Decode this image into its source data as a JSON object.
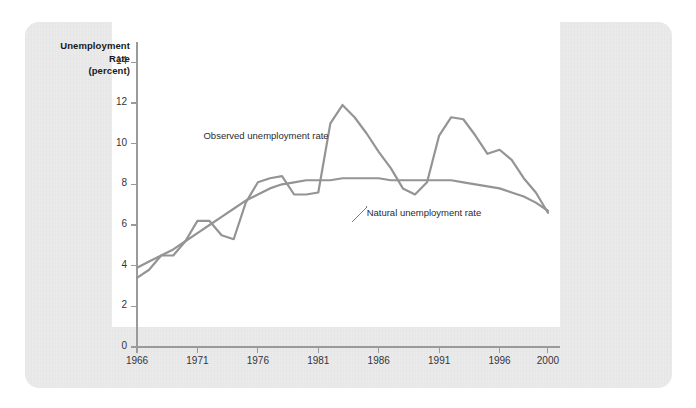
{
  "figure": {
    "axis_title_lines": [
      "Unemployment",
      "Rate",
      "(percent)"
    ],
    "axis_title_line1": "Unemployment",
    "axis_title_line2": "Rate",
    "axis_title_line3": "(percent)",
    "line_color": "#949494",
    "card_color": "#ebebeb",
    "plot_bg": "#ffffff",
    "axis_color": "#9a9a9a"
  },
  "chart_data": {
    "type": "line",
    "title": "Unemployment Rate (percent)",
    "xlabel": "",
    "ylabel": "Unemployment Rate (percent)",
    "xlim": [
      1966,
      2001
    ],
    "ylim": [
      0,
      15
    ],
    "yticks": [
      0,
      2,
      4,
      6,
      8,
      10,
      12,
      14
    ],
    "ytick_labels": [
      "0",
      "2",
      "4",
      "6",
      "8",
      "10",
      "12",
      "14"
    ],
    "xticks": [
      1966,
      1971,
      1976,
      1981,
      1986,
      1991,
      1996,
      2000
    ],
    "xtick_labels": [
      "1966",
      "1971",
      "1976",
      "1981",
      "1986",
      "1991",
      "1996",
      "2000"
    ],
    "grid": false,
    "legend": "annotations",
    "annotations": [
      {
        "text": "Observed unemployment rate",
        "x": 1971.5,
        "y": 10.4
      },
      {
        "text": "Natural unemployment rate",
        "x": 1985.0,
        "y": 6.6
      }
    ],
    "series": [
      {
        "name": "Observed unemployment rate",
        "x": [
          1966,
          1967,
          1968,
          1969,
          1970,
          1971,
          1972,
          1973,
          1974,
          1975,
          1976,
          1977,
          1978,
          1979,
          1980,
          1981,
          1982,
          1983,
          1984,
          1985,
          1986,
          1987,
          1988,
          1989,
          1990,
          1991,
          1992,
          1993,
          1994,
          1995,
          1996,
          1997,
          1998,
          1999,
          2000
        ],
        "y": [
          3.4,
          3.8,
          4.5,
          4.5,
          5.2,
          6.2,
          6.2,
          5.5,
          5.3,
          7.1,
          8.1,
          8.3,
          8.4,
          7.5,
          7.5,
          7.6,
          11.0,
          11.9,
          11.3,
          10.5,
          9.6,
          8.8,
          7.8,
          7.5,
          8.1,
          10.4,
          11.3,
          11.2,
          10.4,
          9.5,
          9.7,
          9.2,
          8.3,
          7.6,
          6.6
        ]
      },
      {
        "name": "Natural unemployment rate",
        "x": [
          1966,
          1967,
          1968,
          1969,
          1970,
          1971,
          1972,
          1973,
          1974,
          1975,
          1976,
          1977,
          1978,
          1979,
          1980,
          1981,
          1982,
          1983,
          1984,
          1985,
          1986,
          1987,
          1988,
          1989,
          1990,
          1991,
          1992,
          1993,
          1994,
          1995,
          1996,
          1997,
          1998,
          1999,
          2000
        ],
        "y": [
          3.9,
          4.2,
          4.5,
          4.8,
          5.2,
          5.6,
          6.0,
          6.4,
          6.8,
          7.2,
          7.5,
          7.8,
          8.0,
          8.1,
          8.2,
          8.2,
          8.2,
          8.3,
          8.3,
          8.3,
          8.3,
          8.2,
          8.2,
          8.2,
          8.2,
          8.2,
          8.2,
          8.1,
          8.0,
          7.9,
          7.8,
          7.6,
          7.4,
          7.1,
          6.7
        ]
      }
    ]
  }
}
